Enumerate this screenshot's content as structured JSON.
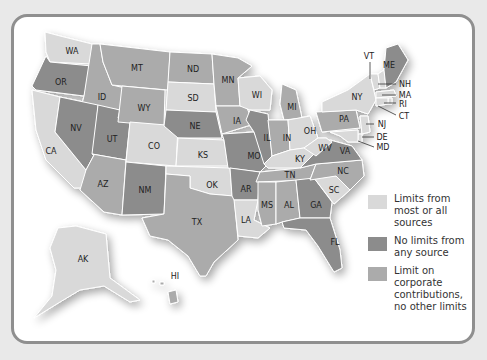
{
  "legend": [
    {
      "key": "limits",
      "label": "Limits from most or all sources",
      "color": "#d9d9d9"
    },
    {
      "key": "none",
      "label": "No limits from any source",
      "color": "#8c8c8c"
    },
    {
      "key": "corp",
      "label": "Limit on corporate contributions, no other limits",
      "color": "#ababab"
    }
  ],
  "colors": {
    "limits": "#d9d9d9",
    "none": "#8c8c8c",
    "corp": "#ababab"
  },
  "states": {
    "WA": "limits",
    "OR": "none",
    "CA": "limits",
    "ID": "corp",
    "NV": "none",
    "UT": "none",
    "AZ": "corp",
    "MT": "corp",
    "WY": "corp",
    "CO": "limits",
    "NM": "none",
    "ND": "corp",
    "SD": "limits",
    "NE": "none",
    "KS": "limits",
    "OK": "limits",
    "TX": "corp",
    "MN": "corp",
    "IA": "corp",
    "MO": "none",
    "AR": "none",
    "LA": "limits",
    "WI": "limits",
    "IL": "none",
    "MI": "corp",
    "IN": "corp",
    "OH": "limits",
    "KY": "limits",
    "TN": "corp",
    "MS": "corp",
    "AL": "corp",
    "GA": "none",
    "FL": "none",
    "SC": "limits",
    "NC": "corp",
    "VA": "none",
    "WV": "limits",
    "PA": "corp",
    "NY": "limits",
    "VT": "limits",
    "ME": "none",
    "NH": "limits",
    "MA": "limits",
    "RI": "limits",
    "CT": "limits",
    "NJ": "limits",
    "DE": "limits",
    "MD": "limits",
    "AK": "limits",
    "HI": "corp"
  },
  "labels": {
    "WA": "WA",
    "OR": "OR",
    "CA": "CA",
    "ID": "ID",
    "NV": "NV",
    "UT": "UT",
    "AZ": "AZ",
    "MT": "MT",
    "WY": "WY",
    "CO": "CO",
    "NM": "NM",
    "ND": "ND",
    "SD": "SD",
    "NE": "NE",
    "KS": "KS",
    "OK": "OK",
    "TX": "TX",
    "MN": "MN",
    "IA": "IA",
    "MO": "MO",
    "AR": "AR",
    "LA": "LA",
    "WI": "WI",
    "IL": "IL",
    "MI": "MI",
    "IN": "IN",
    "OH": "OH",
    "KY": "KY",
    "TN": "TN",
    "MS": "MS",
    "AL": "AL",
    "GA": "GA",
    "FL": "FL",
    "SC": "SC",
    "NC": "NC",
    "VA": "VA",
    "WV": "WV",
    "PA": "PA",
    "NY": "NY",
    "VT": "VT",
    "ME": "ME",
    "NH": "NH",
    "MA": "MA",
    "RI": "RI",
    "CT": "CT",
    "NJ": "NJ",
    "DE": "DE",
    "MD": "MD",
    "AK": "AK",
    "HI": "HI"
  }
}
